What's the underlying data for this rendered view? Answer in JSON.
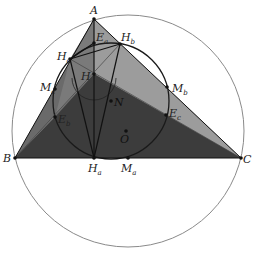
{
  "diagram": {
    "type": "geometry-figure",
    "colors": {
      "background": "#ffffff",
      "circumcircle": "#8a8a8a",
      "nine_point_circle": "#1a1a1a",
      "region_dark": "#3c3c3c",
      "region_mid": "#6a6a6a",
      "region_light": "#9c9c9c",
      "lines": "#111111"
    },
    "circumcircle": {
      "center": "O",
      "cx": 128,
      "cy": 131,
      "r": 116
    },
    "nine_point_circle": {
      "center": "N",
      "cx": 111,
      "cy": 101,
      "r": 58
    },
    "points": [
      {
        "id": "A",
        "label": "A",
        "sub": "",
        "x": 94,
        "y": 19,
        "lx": 90,
        "ly": 14
      },
      {
        "id": "B",
        "label": "B",
        "sub": "",
        "x": 15,
        "y": 158,
        "lx": 3,
        "ly": 162
      },
      {
        "id": "C",
        "label": "C",
        "sub": "",
        "x": 241,
        "y": 158,
        "lx": 243,
        "ly": 163
      },
      {
        "id": "H",
        "label": "H",
        "sub": "",
        "x": 94,
        "y": 74,
        "lx": 81,
        "ly": 80
      },
      {
        "id": "N",
        "label": "N",
        "sub": "",
        "x": 111,
        "y": 101,
        "lx": 114,
        "ly": 106
      },
      {
        "id": "O",
        "label": "O",
        "sub": "",
        "x": 126,
        "y": 131,
        "lx": 120,
        "ly": 143
      },
      {
        "id": "Ha",
        "label": "H",
        "sub": "a",
        "x": 94,
        "y": 158,
        "lx": 88,
        "ly": 172
      },
      {
        "id": "Hb",
        "label": "H",
        "sub": "b",
        "x": 120,
        "y": 44,
        "lx": 121,
        "ly": 41
      },
      {
        "id": "Hc",
        "label": "H",
        "sub": "c",
        "x": 70,
        "y": 59,
        "lx": 57,
        "ly": 60
      },
      {
        "id": "Ma",
        "label": "M",
        "sub": "a",
        "x": 128,
        "y": 158,
        "lx": 121,
        "ly": 172
      },
      {
        "id": "Mb",
        "label": "M",
        "sub": "b",
        "x": 167,
        "y": 87,
        "lx": 172,
        "ly": 92
      },
      {
        "id": "Mc",
        "label": "M",
        "sub": "c",
        "x": 55,
        "y": 89,
        "lx": 40,
        "ly": 91
      },
      {
        "id": "Ea",
        "label": "E",
        "sub": "a",
        "x": 94,
        "y": 43,
        "lx": 96,
        "ly": 41
      },
      {
        "id": "Eb",
        "label": "E",
        "sub": "b",
        "x": 55,
        "y": 117,
        "lx": 58,
        "ly": 123
      },
      {
        "id": "Ec",
        "label": "E",
        "sub": "c",
        "x": 166,
        "y": 115,
        "lx": 169,
        "ly": 117
      }
    ]
  }
}
